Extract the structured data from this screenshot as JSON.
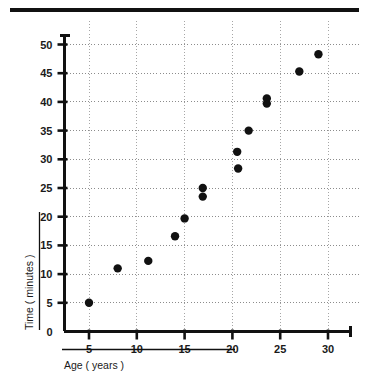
{
  "figure": {
    "top_rule": "horizontal-rule"
  },
  "chart_data": {
    "type": "scatter",
    "title": "",
    "xlabel": "Age ( years )",
    "ylabel": "Time ( minutes )",
    "xlim": [
      0,
      32.5
    ],
    "ylim": [
      0,
      52.5
    ],
    "xticks": [
      5,
      10,
      15,
      20,
      25,
      30
    ],
    "yticks": [
      0,
      5,
      10,
      15,
      20,
      25,
      30,
      35,
      40,
      45,
      50
    ],
    "xtick_labels": [
      "5",
      "10",
      "15",
      "20",
      "25",
      "30"
    ],
    "ytick_labels": [
      "0",
      "5",
      "10",
      "15",
      "20",
      "25",
      "30",
      "35",
      "40",
      "45",
      "50"
    ],
    "grid": true,
    "grid_style": "dotted",
    "legend": "none",
    "marker": "filled-circle",
    "marker_color": "#111111",
    "points": [
      {
        "x": 5.0,
        "y": 5.0
      },
      {
        "x": 8.0,
        "y": 11.0
      },
      {
        "x": 11.2,
        "y": 12.3
      },
      {
        "x": 14.0,
        "y": 16.6
      },
      {
        "x": 15.0,
        "y": 19.7
      },
      {
        "x": 16.9,
        "y": 23.5
      },
      {
        "x": 16.9,
        "y": 25.0
      },
      {
        "x": 20.6,
        "y": 28.4
      },
      {
        "x": 20.5,
        "y": 31.3
      },
      {
        "x": 21.7,
        "y": 35.0
      },
      {
        "x": 23.6,
        "y": 39.7
      },
      {
        "x": 23.6,
        "y": 40.6
      },
      {
        "x": 27.0,
        "y": 45.3
      },
      {
        "x": 29.0,
        "y": 48.3
      }
    ]
  }
}
